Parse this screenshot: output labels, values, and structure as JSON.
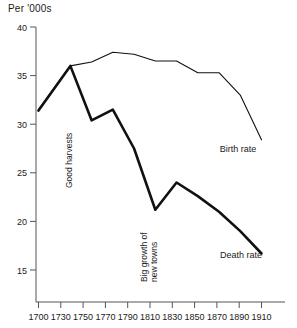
{
  "chart_data": {
    "type": "line",
    "title": "Per '000s",
    "xlabel": "",
    "ylabel": "Per '000s",
    "xlim": [
      1700,
      1915
    ],
    "ylim": [
      12.5,
      40
    ],
    "yticks": [
      15,
      20,
      25,
      30,
      35,
      40
    ],
    "xticks": [
      1700,
      1730,
      1750,
      1770,
      1790,
      1810,
      1830,
      1850,
      1870,
      1890,
      1910
    ],
    "grid": false,
    "legend_position": "inline-right",
    "series": [
      {
        "name": "Birth rate",
        "label": "Birth rate",
        "style": "thin",
        "x": [
          1700,
          1730,
          1750,
          1770,
          1790,
          1810,
          1830,
          1850,
          1870,
          1890,
          1910
        ],
        "values": [
          31.5,
          36.0,
          36.4,
          37.4,
          37.2,
          36.5,
          36.5,
          35.3,
          35.3,
          33.0,
          28.4
        ]
      },
      {
        "name": "Death rate",
        "label": "Death rate",
        "style": "thick",
        "x": [
          1700,
          1730,
          1750,
          1770,
          1790,
          1810,
          1830,
          1850,
          1870,
          1890,
          1910
        ],
        "values": [
          31.4,
          36.0,
          30.4,
          31.5,
          27.5,
          21.2,
          24.0,
          22.6,
          21.0,
          19.0,
          16.7
        ]
      }
    ],
    "annotations": [
      {
        "text": "Good harvests",
        "x": 1750,
        "rotated": true
      },
      {
        "text": "Big growth of",
        "x": 1812,
        "rotated": true
      },
      {
        "text": "new towns",
        "x": 1812,
        "rotated": true
      }
    ]
  },
  "colors": {
    "axis": "#555555",
    "line": "#111111",
    "background": "#ffffff"
  }
}
